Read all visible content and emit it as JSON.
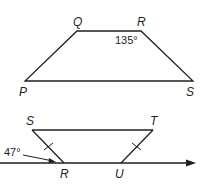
{
  "figures": [
    {
      "name": "trapezoid-PQRS",
      "vertices": {
        "Q": {
          "label": "Q"
        },
        "R": {
          "label": "R"
        },
        "P": {
          "label": "P"
        },
        "S": {
          "label": "S"
        }
      },
      "angle_label": "135°"
    },
    {
      "name": "trapezoid-STUR-on-ray",
      "vertices": {
        "S": {
          "label": "S"
        },
        "T": {
          "label": "T"
        },
        "R": {
          "label": "R"
        },
        "U": {
          "label": "U"
        }
      },
      "angle_label": "47°",
      "congruence_marks": "SR ≅ TU (single tick)"
    }
  ],
  "colors": {
    "stroke": "#231f20",
    "background": "#ffffff"
  }
}
